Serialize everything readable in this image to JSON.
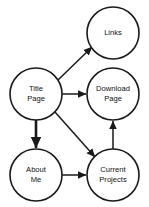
{
  "diagram": {
    "type": "directed-graph",
    "canvas": {
      "width": 149,
      "height": 207
    },
    "style": {
      "background_color": "#ffffff",
      "node_fill": "#ffffff",
      "node_stroke": "#1a1a1a",
      "edge_color": "#1a1a1a",
      "text_color": "#111111"
    },
    "nodes": [
      {
        "id": "links",
        "label": "Links",
        "lines": [
          "Links"
        ],
        "cx": 113,
        "cy": 33,
        "r": 26
      },
      {
        "id": "title_page",
        "label": "Title Page",
        "lines": [
          "Title",
          "Page"
        ],
        "cx": 36,
        "cy": 94,
        "r": 26
      },
      {
        "id": "download_page",
        "label": "Download Page",
        "lines": [
          "Download",
          "Page"
        ],
        "cx": 113,
        "cy": 94,
        "r": 26
      },
      {
        "id": "about_me",
        "label": "About Me",
        "lines": [
          "About",
          "Me"
        ],
        "cx": 36,
        "cy": 175,
        "r": 26
      },
      {
        "id": "current_projects",
        "label": "Current Projects",
        "lines": [
          "Current",
          "Projects"
        ],
        "cx": 113,
        "cy": 175,
        "r": 26
      }
    ],
    "edges": [
      {
        "id": "title-to-links",
        "from": "title_page",
        "to": "links",
        "from_label": "Title Page",
        "to_label": "Links",
        "x1": 58,
        "y1": 80,
        "x2": 92,
        "y2": 47,
        "weight": "normal"
      },
      {
        "id": "title-to-download",
        "from": "title_page",
        "to": "download_page",
        "from_label": "Title Page",
        "to_label": "Download Page",
        "x1": 62,
        "y1": 94,
        "x2": 86,
        "y2": 94,
        "weight": "normal"
      },
      {
        "id": "title-to-about",
        "from": "title_page",
        "to": "about_me",
        "from_label": "Title Page",
        "to_label": "About Me",
        "x1": 36,
        "y1": 120,
        "x2": 36,
        "y2": 148,
        "weight": "bold"
      },
      {
        "id": "title-to-projects",
        "from": "title_page",
        "to": "current_projects",
        "from_label": "Title Page",
        "to_label": "Current Projects",
        "x1": 55,
        "y1": 112,
        "x2": 95,
        "y2": 157,
        "weight": "normal"
      },
      {
        "id": "about-to-projects",
        "from": "about_me",
        "to": "current_projects",
        "from_label": "About Me",
        "to_label": "Current Projects",
        "x1": 62,
        "y1": 175,
        "x2": 86,
        "y2": 175,
        "weight": "normal"
      },
      {
        "id": "projects-to-download",
        "from": "current_projects",
        "to": "download_page",
        "from_label": "Current Projects",
        "to_label": "Download Page",
        "x1": 113,
        "y1": 149,
        "x2": 113,
        "y2": 121,
        "weight": "normal"
      }
    ]
  }
}
